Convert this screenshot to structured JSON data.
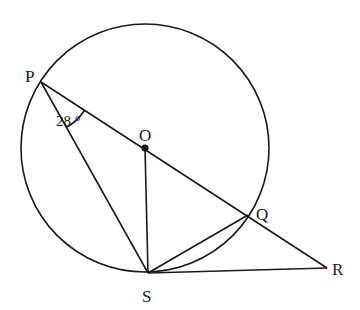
{
  "figure": {
    "type": "circle-geometry",
    "circle": {
      "center_label": "O",
      "cx": 145,
      "cy": 148,
      "r": 124
    },
    "points": {
      "P": {
        "label": "P",
        "x": 41,
        "y": 82
      },
      "O": {
        "label": "O",
        "x": 145,
        "y": 148
      },
      "Q": {
        "label": "Q",
        "x": 248,
        "y": 215
      },
      "R": {
        "label": "R",
        "x": 327,
        "y": 268
      },
      "S": {
        "label": "S",
        "x": 148,
        "y": 273
      }
    },
    "segments": [
      [
        "P",
        "R"
      ],
      [
        "P",
        "S"
      ],
      [
        "O",
        "S"
      ],
      [
        "S",
        "Q"
      ],
      [
        "S",
        "R"
      ]
    ],
    "angle_mark": {
      "vertex": "P",
      "between": [
        "S",
        "O"
      ],
      "label": "28 °",
      "value_degrees": 28
    },
    "stroke_color": "#1a1a1a",
    "background": "#ffffff"
  }
}
